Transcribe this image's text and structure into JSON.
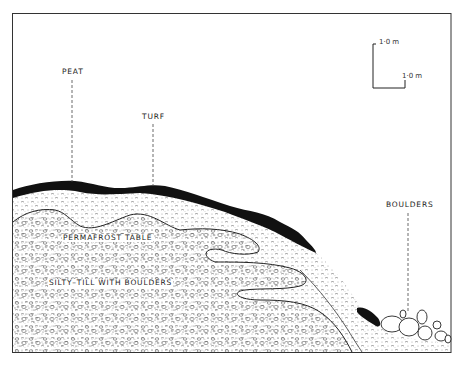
{
  "figure": {
    "type": "geological cross-section",
    "colors": {
      "line": "#222222",
      "peat_turf": "#111111",
      "fill_dots": "#555555",
      "background": "#ffffff"
    }
  },
  "labels": {
    "peat": "PEAT",
    "turf": "TURF",
    "boulders": "BOULDERS",
    "permafrost_table": "PERMAFROST TABLE",
    "silty_till": "SILTY–TILL WITH BOULDERS"
  },
  "scale_bar": {
    "vertical_label": "1·0 m",
    "horizontal_label": "1·0 m"
  }
}
